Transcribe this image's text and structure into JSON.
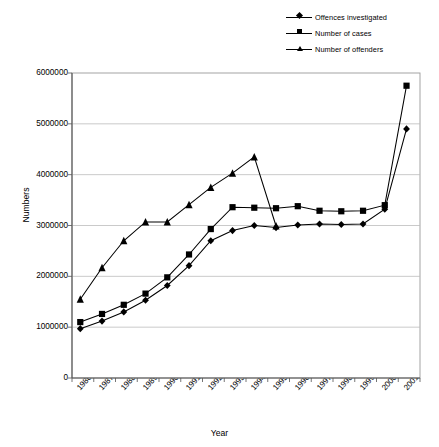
{
  "chart_data": {
    "type": "line",
    "title": "",
    "xlabel": "Year",
    "ylabel": "Numbers",
    "categories": [
      "1986",
      "1987",
      "1988",
      "1989",
      "1990",
      "1991",
      "1992",
      "1993",
      "1994",
      "1995",
      "1996",
      "1997",
      "1998",
      "1999",
      "2000",
      "2001"
    ],
    "ylim": [
      0,
      6000000
    ],
    "ytick_values": [
      0,
      1000000,
      2000000,
      3000000,
      4000000,
      5000000,
      6000000
    ],
    "ytick_labels": [
      "0",
      "1000000",
      "2000000",
      "3000000",
      "4000000",
      "5000000",
      "6000000"
    ],
    "grid": true,
    "legend_position": "top-right",
    "series": [
      {
        "name": "Offences investigated",
        "marker": "diamond",
        "values": [
          970000,
          1120000,
          1300000,
          1530000,
          1820000,
          2210000,
          2700000,
          2900000,
          3000000,
          2960000,
          3010000,
          3030000,
          3020000,
          3030000,
          3320000,
          4900000
        ]
      },
      {
        "name": "Number of cases",
        "marker": "square",
        "values": [
          1100000,
          1260000,
          1440000,
          1660000,
          1980000,
          2430000,
          2930000,
          3360000,
          3350000,
          3340000,
          3380000,
          3290000,
          3280000,
          3290000,
          3400000,
          5750000
        ]
      },
      {
        "name": "Number of offenders",
        "marker": "triangle",
        "values": [
          1550000,
          2170000,
          2700000,
          3070000,
          3070000,
          3410000,
          3750000,
          4030000,
          4350000,
          2990000,
          null,
          null,
          null,
          null,
          null,
          null
        ]
      }
    ]
  },
  "legend": {
    "items": [
      {
        "label": "Offences investigated",
        "marker": "diamond"
      },
      {
        "label": "Number of cases",
        "marker": "square"
      },
      {
        "label": "Number of offenders",
        "marker": "triangle"
      }
    ]
  }
}
